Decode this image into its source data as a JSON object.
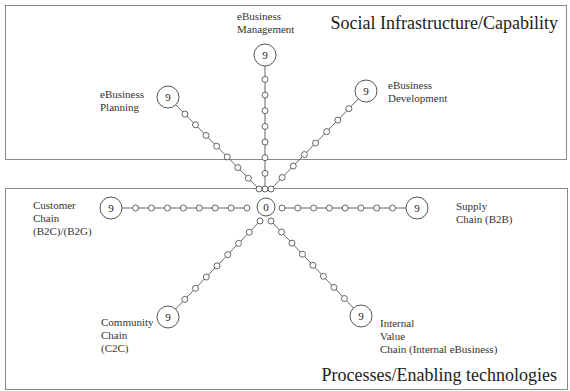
{
  "panels": {
    "top": {
      "title": "Social Infrastructure/Capability"
    },
    "bottom": {
      "title": "Processes/Enabling technologies"
    }
  },
  "center": {
    "value": "0",
    "x": 266,
    "y": 207,
    "r": 9
  },
  "colors": {
    "line": "#555555",
    "panel_border": "#8a8a8a",
    "text": "#2a2a2a"
  },
  "axes": [
    {
      "id": "ebusiness-management",
      "label": "eBusiness\nManagement",
      "end_value": "9",
      "start": [
        265,
        189
      ],
      "end": [
        265,
        55
      ],
      "label_pos": [
        237,
        10
      ],
      "nodes": 8
    },
    {
      "id": "ebusiness-planning",
      "label": "eBusiness\nPlanning",
      "end_value": "9",
      "start": [
        259,
        189
      ],
      "end": [
        168,
        97
      ],
      "label_pos": [
        100,
        88
      ],
      "nodes": 8
    },
    {
      "id": "ebusiness-development",
      "label": "eBusiness\nDevelopment",
      "end_value": "9",
      "start": [
        271,
        189
      ],
      "end": [
        366,
        91
      ],
      "label_pos": [
        388,
        79
      ],
      "nodes": 8
    },
    {
      "id": "customer-chain",
      "label": "Customer\nChain\n(B2C)/(B2G)",
      "end_value": "9",
      "start": [
        247,
        208
      ],
      "end": [
        111,
        208
      ],
      "label_pos": [
        33,
        199
      ],
      "nodes": 8
    },
    {
      "id": "supply-chain",
      "label": "Supply\nChain (B2B)",
      "end_value": "9",
      "start": [
        282,
        208
      ],
      "end": [
        417,
        208
      ],
      "label_pos": [
        456,
        200
      ],
      "nodes": 8
    },
    {
      "id": "community-chain",
      "label": "Community\nChain\n(C2C)",
      "end_value": "9",
      "start": [
        260,
        221
      ],
      "end": [
        168,
        317
      ],
      "label_pos": [
        101,
        316
      ],
      "nodes": 8
    },
    {
      "id": "internal-value-chain",
      "label": "Internal\nValue\nChain (Internal eBusiness)",
      "end_value": "9",
      "start": [
        271,
        221
      ],
      "end": [
        361,
        316
      ],
      "label_pos": [
        380,
        317
      ],
      "nodes": 8
    }
  ]
}
